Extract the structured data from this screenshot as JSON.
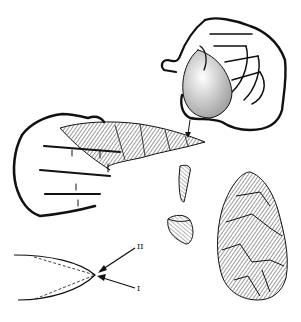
{
  "figure": {
    "parts": [
      {
        "id": "hammer-hand",
        "description": "Right hand gripping a hammerstone, striking downward"
      },
      {
        "id": "core-hand",
        "description": "Left hand holding the flint core being worked"
      },
      {
        "id": "flakes",
        "description": "Two detached flakes"
      },
      {
        "id": "handaxe",
        "description": "Finished bifacial hand axe"
      },
      {
        "id": "edge-diagram",
        "description": "Cross-section of edge showing strike directions"
      }
    ],
    "labels": {
      "upper_arrow": "II",
      "lower_arrow": "I"
    },
    "colors": {
      "ink": "#111111",
      "background": "#ffffff"
    }
  }
}
